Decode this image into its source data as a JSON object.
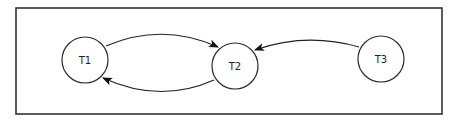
{
  "diagram": {
    "type": "directed-graph",
    "colors": {
      "frame": "#333333",
      "stroke": "#222222",
      "background": "#ffffff"
    },
    "nodes": [
      {
        "id": "T1",
        "label": "T1",
        "cx": 85,
        "cy": 60,
        "r": 23
      },
      {
        "id": "T2",
        "label": "T2",
        "cx": 235,
        "cy": 66,
        "r": 23
      },
      {
        "id": "T3",
        "label": "T3",
        "cx": 381,
        "cy": 59,
        "r": 23
      }
    ],
    "edges": [
      {
        "from": "T1",
        "to": "T2"
      },
      {
        "from": "T2",
        "to": "T1"
      },
      {
        "from": "T3",
        "to": "T2"
      }
    ]
  }
}
